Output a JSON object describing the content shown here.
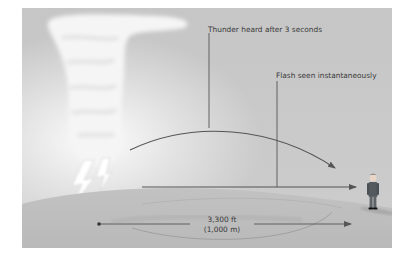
{
  "diagram": {
    "labels": {
      "thunder": "Thunder heard after 3 seconds",
      "flash": "Flash seen instantaneously",
      "distance_ft": "3,300 ft",
      "distance_m": "(1,000 m)"
    },
    "elements": {
      "cloud": "thundercloud",
      "lightning": "lightning-bolt",
      "observer": "person-standing",
      "sound_path": "curved arrow (thunder)",
      "light_path": "straight arrow (flash)",
      "distance_arrow": "double-headed distance arrow"
    },
    "colors": {
      "background": "#c9c9c9",
      "sky_top": "#c4c4c4",
      "ground": "#bdbdbd",
      "line": "#555555",
      "text": "#3a3a3a",
      "cloud": "#f4f4f4"
    }
  }
}
